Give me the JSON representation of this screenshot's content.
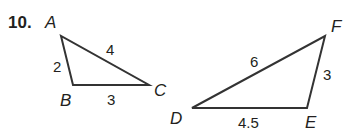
{
  "problem": {
    "number": "10."
  },
  "triangles": [
    {
      "name": "ABC",
      "vertices": [
        {
          "label": "A",
          "x": 61,
          "y": 36
        },
        {
          "label": "B",
          "x": 73,
          "y": 85
        },
        {
          "label": "C",
          "x": 149,
          "y": 85
        }
      ],
      "sides": [
        {
          "between": "AB",
          "length": "2"
        },
        {
          "between": "BC",
          "length": "3"
        },
        {
          "between": "AC",
          "length": "4"
        }
      ]
    },
    {
      "name": "DEF",
      "vertices": [
        {
          "label": "D",
          "x": 192,
          "y": 108
        },
        {
          "label": "E",
          "x": 307,
          "y": 108
        },
        {
          "label": "F",
          "x": 325,
          "y": 36
        }
      ],
      "sides": [
        {
          "between": "DE",
          "length": "4.5"
        },
        {
          "between": "EF",
          "length": "3"
        },
        {
          "between": "DF",
          "length": "6"
        }
      ]
    }
  ],
  "colors": {
    "line": "#333333",
    "text": "#231f20",
    "background": "#ffffff"
  }
}
